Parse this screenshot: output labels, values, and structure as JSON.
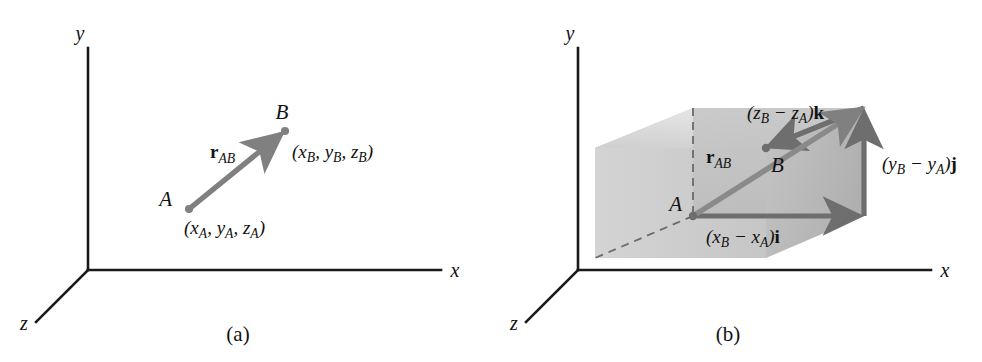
{
  "figure": {
    "colors": {
      "axis": "#1a1a1a",
      "vector": "#808080",
      "vector_dark": "#6e6e6e",
      "box_top": "#d9d9d9",
      "box_left": "#c9c9c9",
      "box_front": "#c2c2c2",
      "box_right": "#b8b8b8",
      "dashed": "#555555",
      "text": "#111111",
      "background": "#ffffff"
    }
  },
  "panels": [
    {
      "id": "panel-a",
      "caption": "(a)",
      "axes": {
        "y_label": "y",
        "x_label": "x",
        "z_label": "z"
      },
      "points": [
        {
          "name": "A",
          "label": "A",
          "coord_open": "(",
          "coord_close": ")",
          "coords": [
            {
              "var": "x",
              "sub": "A",
              "sep": ", "
            },
            {
              "var": "y",
              "sub": "A",
              "sep": ", "
            },
            {
              "var": "z",
              "sub": "A",
              "sep": ""
            }
          ],
          "coord_text": "(xA, yA, zA)"
        },
        {
          "name": "B",
          "label": "B",
          "coord_open": "(",
          "coord_close": ")",
          "coords": [
            {
              "var": "x",
              "sub": "B",
              "sep": ", "
            },
            {
              "var": "y",
              "sub": "B",
              "sep": ", "
            },
            {
              "var": "z",
              "sub": "B",
              "sep": ""
            }
          ],
          "coord_text": "(xB, yB, zB)"
        }
      ],
      "vectors": [
        {
          "name": "r-ab",
          "symbol": "r",
          "subscript": "AB",
          "label_text": "rAB",
          "from": "A",
          "to": "B"
        }
      ]
    },
    {
      "id": "panel-b",
      "caption": "(b)",
      "axes": {
        "y_label": "y",
        "x_label": "x",
        "z_label": "z"
      },
      "points": [
        {
          "name": "A",
          "label": "A"
        },
        {
          "name": "B",
          "label": "B"
        }
      ],
      "vectors": [
        {
          "name": "r-ab",
          "symbol": "r",
          "subscript": "AB",
          "label_text": "rAB"
        },
        {
          "name": "x-component",
          "open": "(",
          "minuend_var": "x",
          "minuend_sub": "B",
          "operator": " − ",
          "subtrahend_var": "x",
          "subtrahend_sub": "A",
          "close": ")",
          "unit": "i",
          "label_text": "(xB − xA)i"
        },
        {
          "name": "y-component",
          "open": "(",
          "minuend_var": "y",
          "minuend_sub": "B",
          "operator": " − ",
          "subtrahend_var": "y",
          "subtrahend_sub": "A",
          "close": ")",
          "unit": "j",
          "label_text": "(yB − yA)j"
        },
        {
          "name": "z-component",
          "open": "(",
          "minuend_var": "z",
          "minuend_sub": "B",
          "operator": " − ",
          "subtrahend_var": "z",
          "subtrahend_sub": "A",
          "close": ")",
          "unit": "k",
          "label_text": "(zB − zA)k"
        }
      ]
    }
  ]
}
